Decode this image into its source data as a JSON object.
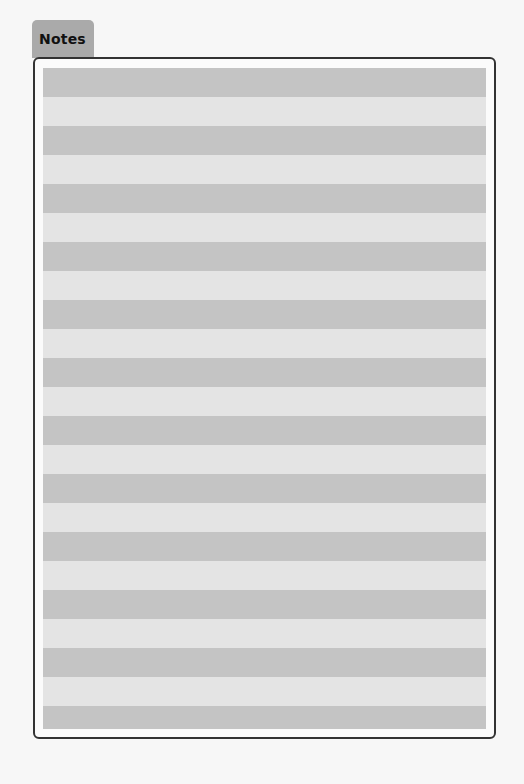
{
  "tab": {
    "label": "Notes"
  },
  "notes": {
    "line_count": 23,
    "colors": {
      "dark_band": "#c4c4c4",
      "light_band": "#e4e4e4",
      "tab": "#aaaaaa",
      "border": "#333333"
    },
    "lines": [
      "",
      "",
      "",
      "",
      "",
      "",
      "",
      "",
      "",
      "",
      "",
      "",
      "",
      "",
      "",
      "",
      "",
      "",
      "",
      "",
      "",
      "",
      ""
    ]
  }
}
